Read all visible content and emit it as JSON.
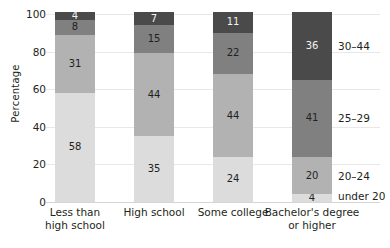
{
  "chart_data": {
    "type": "bar",
    "stacked": true,
    "title": "",
    "xlabel": "",
    "ylabel": "Percentage",
    "ylim": [
      0,
      100
    ],
    "yticks": [
      0,
      20,
      40,
      60,
      80,
      100
    ],
    "ytick_labels": [
      "0",
      "20",
      "40",
      "60",
      "80",
      "100"
    ],
    "grid": true,
    "legend_position": "right-inline",
    "categories": [
      "Less than high school",
      "High school",
      "Some college",
      "Bachelor's degree or higher"
    ],
    "category_lines": [
      [
        "Less than",
        "high school"
      ],
      [
        "High school"
      ],
      [
        "Some college"
      ],
      [
        "Bachelor's degree",
        "or higher"
      ]
    ],
    "series": [
      {
        "name": "under 20",
        "color": "#dcdcdc",
        "values": [
          58,
          35,
          24,
          4
        ]
      },
      {
        "name": "20–24",
        "color": "#b2b2b2",
        "values": [
          31,
          44,
          44,
          20
        ]
      },
      {
        "name": "25–29",
        "color": "#808080",
        "values": [
          8,
          15,
          22,
          41
        ]
      },
      {
        "name": "30–44",
        "color": "#4a4a4a",
        "values": [
          4,
          7,
          11,
          36
        ]
      }
    ],
    "value_labels": {
      "bar0": [
        "58",
        "31",
        "8",
        "4"
      ],
      "bar1": [
        "35",
        "44",
        "15",
        "7"
      ],
      "bar2": [
        "24",
        "44",
        "22",
        "11"
      ],
      "bar3": [
        "4",
        "20",
        "41",
        "36"
      ]
    },
    "right_labels": [
      {
        "text": "30–44",
        "series": "30–44"
      },
      {
        "text": "25–29",
        "series": "25–29"
      },
      {
        "text": "20–24",
        "series": "20–24"
      },
      {
        "text": "under 20",
        "series": "under 20"
      }
    ]
  }
}
